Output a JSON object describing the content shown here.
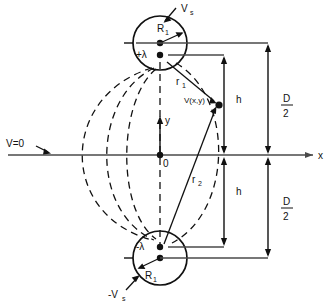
{
  "diagram": {
    "colors": {
      "line": "#111111",
      "axis": "#4a4a4a",
      "dashed": "#111111",
      "background": "#ffffff"
    },
    "labels": {
      "top_potential": "V",
      "top_potential_sub": "s",
      "bottom_potential": "-V",
      "bottom_potential_sub": "s",
      "top_radius": "R",
      "top_radius_sub": "1",
      "bottom_radius": "R",
      "bottom_radius_sub": "1",
      "top_charge": "+λ",
      "bottom_charge": "-λ",
      "field_point": "V(x,y)",
      "distance_1": "r",
      "distance_1_sub": "1",
      "distance_2": "r",
      "distance_2_sub": "2",
      "ground_plane": "V=0",
      "x_axis": "x",
      "y_axis": "y",
      "origin": "0",
      "height_upper": "h",
      "height_lower": "h",
      "separation_upper_num": "D",
      "separation_upper_den": "2",
      "separation_lower_num": "D",
      "separation_lower_den": "2"
    },
    "geometry": {
      "top_circle_center_x": 160,
      "top_circle_center_y": 43,
      "top_circle_radius": 27,
      "bottom_circle_center_x": 160,
      "bottom_circle_center_y": 258,
      "bottom_circle_radius": 27,
      "top_charge_y": 55,
      "bottom_charge_y": 247,
      "axis_y": 155,
      "origin_x": 160,
      "field_point_x": 219,
      "field_point_y": 105
    }
  }
}
